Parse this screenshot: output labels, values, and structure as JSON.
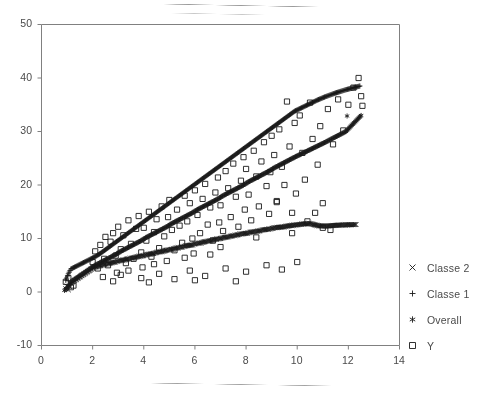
{
  "chart_data": {
    "type": "scatter",
    "title": "",
    "xlabel": "",
    "ylabel": "",
    "xlim": [
      0,
      14
    ],
    "ylim": [
      -10,
      50
    ],
    "xticks": [
      0,
      2,
      4,
      6,
      8,
      10,
      12,
      14
    ],
    "yticks": [
      -10,
      0,
      10,
      20,
      30,
      40,
      50
    ],
    "grid": false,
    "legend_position": "right",
    "frame": "open-left-top-right",
    "marker_color": "#1a1a1a",
    "axis_color": "#808080",
    "text_color": "#4a4a4a",
    "series": [
      {
        "name": "Classe 2",
        "marker": "cross",
        "description": "Lower flat fitted band, slope ~0.85",
        "points": [
          [
            0.95,
            0.6
          ],
          [
            1.0,
            1.1
          ],
          [
            1.05,
            0.4
          ],
          [
            1.12,
            1.6
          ],
          [
            2.05,
            4.6
          ],
          [
            2.2,
            4.8
          ],
          [
            2.35,
            5.0
          ],
          [
            2.5,
            5.2
          ],
          [
            2.62,
            5.3
          ],
          [
            2.75,
            5.5
          ],
          [
            2.88,
            5.6
          ],
          [
            3.0,
            5.8
          ],
          [
            3.12,
            5.9
          ],
          [
            3.25,
            6.0
          ],
          [
            3.38,
            6.2
          ],
          [
            3.5,
            6.3
          ],
          [
            3.62,
            6.4
          ],
          [
            3.75,
            6.6
          ],
          [
            3.88,
            6.7
          ],
          [
            4.0,
            6.8
          ],
          [
            4.12,
            7.0
          ],
          [
            4.25,
            7.1
          ],
          [
            4.38,
            7.2
          ],
          [
            4.5,
            7.4
          ],
          [
            4.62,
            7.5
          ],
          [
            4.75,
            7.6
          ],
          [
            4.88,
            7.8
          ],
          [
            5.0,
            7.9
          ],
          [
            5.12,
            8.0
          ],
          [
            5.25,
            8.2
          ],
          [
            5.38,
            8.3
          ],
          [
            5.5,
            8.4
          ],
          [
            5.62,
            8.6
          ],
          [
            5.75,
            8.7
          ],
          [
            5.88,
            8.8
          ],
          [
            6.0,
            9.0
          ],
          [
            6.12,
            9.1
          ],
          [
            6.25,
            9.2
          ],
          [
            6.38,
            9.4
          ],
          [
            6.5,
            9.5
          ],
          [
            6.62,
            9.6
          ],
          [
            6.75,
            9.8
          ],
          [
            6.88,
            9.9
          ],
          [
            7.0,
            10.0
          ],
          [
            7.15,
            10.2
          ],
          [
            7.3,
            10.3
          ],
          [
            7.45,
            10.5
          ],
          [
            7.6,
            10.6
          ],
          [
            7.75,
            10.8
          ],
          [
            7.9,
            10.9
          ],
          [
            8.05,
            11.0
          ],
          [
            8.2,
            11.2
          ],
          [
            8.35,
            11.3
          ],
          [
            8.5,
            11.4
          ],
          [
            8.65,
            11.6
          ],
          [
            8.8,
            11.7
          ],
          [
            8.95,
            11.8
          ],
          [
            9.1,
            12.0
          ],
          [
            9.3,
            12.1
          ],
          [
            9.5,
            12.2
          ],
          [
            9.7,
            12.4
          ],
          [
            9.9,
            12.5
          ],
          [
            10.2,
            12.7
          ],
          [
            10.5,
            12.8
          ],
          [
            10.8,
            12.4
          ],
          [
            11.1,
            12.3
          ],
          [
            11.6,
            12.5
          ],
          [
            12.3,
            12.6
          ]
        ]
      },
      {
        "name": "Classe 1",
        "marker": "plus",
        "description": "Upper steep fitted band, slope ~3.3",
        "points": [
          [
            0.95,
            2.2
          ],
          [
            1.05,
            3.4
          ],
          [
            1.15,
            4.3
          ],
          [
            2.1,
            6.6
          ],
          [
            2.3,
            7.2
          ],
          [
            2.5,
            7.9
          ],
          [
            2.7,
            8.6
          ],
          [
            2.9,
            9.3
          ],
          [
            3.1,
            10.0
          ],
          [
            3.3,
            10.7
          ],
          [
            3.5,
            11.4
          ],
          [
            3.7,
            12.1
          ],
          [
            3.9,
            12.8
          ],
          [
            4.1,
            13.5
          ],
          [
            4.3,
            14.2
          ],
          [
            4.5,
            14.9
          ],
          [
            4.7,
            15.6
          ],
          [
            4.9,
            16.3
          ],
          [
            5.1,
            17.0
          ],
          [
            5.3,
            17.7
          ],
          [
            5.5,
            18.4
          ],
          [
            5.7,
            19.1
          ],
          [
            5.9,
            19.8
          ],
          [
            6.1,
            20.5
          ],
          [
            6.3,
            21.2
          ],
          [
            6.5,
            21.9
          ],
          [
            6.7,
            22.6
          ],
          [
            6.9,
            23.3
          ],
          [
            7.1,
            24.0
          ],
          [
            7.3,
            24.7
          ],
          [
            7.5,
            25.4
          ],
          [
            7.7,
            26.1
          ],
          [
            7.9,
            26.8
          ],
          [
            8.1,
            27.5
          ],
          [
            8.3,
            28.2
          ],
          [
            8.5,
            28.9
          ],
          [
            8.7,
            29.6
          ],
          [
            8.9,
            30.3
          ],
          [
            9.1,
            31.0
          ],
          [
            9.3,
            31.7
          ],
          [
            9.5,
            32.4
          ],
          [
            9.7,
            33.1
          ],
          [
            9.9,
            33.8
          ],
          [
            10.2,
            34.5
          ],
          [
            10.5,
            35.2
          ],
          [
            10.8,
            35.9
          ],
          [
            11.1,
            36.5
          ],
          [
            11.5,
            37.2
          ],
          [
            11.9,
            37.8
          ],
          [
            12.45,
            38.5
          ]
        ]
      },
      {
        "name": "Overall",
        "marker": "asterisk",
        "description": "Middle fitted band, slope ~2.6",
        "points": [
          [
            0.9,
            0.3
          ],
          [
            1.0,
            0.8
          ],
          [
            1.1,
            1.4
          ],
          [
            1.2,
            2.0
          ],
          [
            2.1,
            5.0
          ],
          [
            2.3,
            5.5
          ],
          [
            2.5,
            6.0
          ],
          [
            2.7,
            6.5
          ],
          [
            2.9,
            7.0
          ],
          [
            3.1,
            7.6
          ],
          [
            3.3,
            8.1
          ],
          [
            3.5,
            8.6
          ],
          [
            3.7,
            9.1
          ],
          [
            3.9,
            9.6
          ],
          [
            4.1,
            10.2
          ],
          [
            4.3,
            10.7
          ],
          [
            4.5,
            11.2
          ],
          [
            4.7,
            11.7
          ],
          [
            4.9,
            12.2
          ],
          [
            5.1,
            12.8
          ],
          [
            5.3,
            13.3
          ],
          [
            5.5,
            13.8
          ],
          [
            5.7,
            14.3
          ],
          [
            5.9,
            14.8
          ],
          [
            6.1,
            15.4
          ],
          [
            6.3,
            15.9
          ],
          [
            6.5,
            16.4
          ],
          [
            6.7,
            16.9
          ],
          [
            6.9,
            17.4
          ],
          [
            7.1,
            18.0
          ],
          [
            7.3,
            18.5
          ],
          [
            7.5,
            19.0
          ],
          [
            7.7,
            19.5
          ],
          [
            7.9,
            20.0
          ],
          [
            8.1,
            20.6
          ],
          [
            8.3,
            21.1
          ],
          [
            8.5,
            21.6
          ],
          [
            8.7,
            22.1
          ],
          [
            8.9,
            22.6
          ],
          [
            9.1,
            23.2
          ],
          [
            9.3,
            23.7
          ],
          [
            9.5,
            24.2
          ],
          [
            9.7,
            24.7
          ],
          [
            9.9,
            25.2
          ],
          [
            10.2,
            25.9
          ],
          [
            10.5,
            26.6
          ],
          [
            10.8,
            27.3
          ],
          [
            11.1,
            28.0
          ],
          [
            11.5,
            29.0
          ],
          [
            11.9,
            30.0
          ],
          [
            12.2,
            31.5
          ],
          [
            12.5,
            33.0
          ],
          [
            11.95,
            32.9
          ]
        ]
      },
      {
        "name": "Y",
        "marker": "square",
        "description": "Raw observations scattered around all three bands",
        "points": [
          [
            0.95,
            1.9
          ],
          [
            1.05,
            2.6
          ],
          [
            1.15,
            0.9
          ],
          [
            1.25,
            1.2
          ],
          [
            2.0,
            5.6
          ],
          [
            2.1,
            7.6
          ],
          [
            2.2,
            4.4
          ],
          [
            2.3,
            8.8
          ],
          [
            2.45,
            6.2
          ],
          [
            2.5,
            10.3
          ],
          [
            2.6,
            5.0
          ],
          [
            2.7,
            9.4
          ],
          [
            2.8,
            11.0
          ],
          [
            2.9,
            6.8
          ],
          [
            2.95,
            3.6
          ],
          [
            3.0,
            12.2
          ],
          [
            3.1,
            8.0
          ],
          [
            3.2,
            10.6
          ],
          [
            3.3,
            5.4
          ],
          [
            3.4,
            13.4
          ],
          [
            3.5,
            9.0
          ],
          [
            3.6,
            6.2
          ],
          [
            3.7,
            11.8
          ],
          [
            3.8,
            14.2
          ],
          [
            3.9,
            7.4
          ],
          [
            3.95,
            4.6
          ],
          [
            4.0,
            12.0
          ],
          [
            4.1,
            9.6
          ],
          [
            4.2,
            15.0
          ],
          [
            4.3,
            6.6
          ],
          [
            4.4,
            11.2
          ],
          [
            4.5,
            13.6
          ],
          [
            4.6,
            8.2
          ],
          [
            4.7,
            16.0
          ],
          [
            4.8,
            10.4
          ],
          [
            4.9,
            5.8
          ],
          [
            4.95,
            14.0
          ],
          [
            5.0,
            17.2
          ],
          [
            5.1,
            11.6
          ],
          [
            5.2,
            7.8
          ],
          [
            5.3,
            15.4
          ],
          [
            5.4,
            12.4
          ],
          [
            5.5,
            9.2
          ],
          [
            5.6,
            18.0
          ],
          [
            5.7,
            13.2
          ],
          [
            5.8,
            16.6
          ],
          [
            5.9,
            10.0
          ],
          [
            5.95,
            7.2
          ],
          [
            6.0,
            19.0
          ],
          [
            6.1,
            14.4
          ],
          [
            6.2,
            11.0
          ],
          [
            6.3,
            17.4
          ],
          [
            6.4,
            20.2
          ],
          [
            6.5,
            12.6
          ],
          [
            6.6,
            15.8
          ],
          [
            6.7,
            9.6
          ],
          [
            6.8,
            18.6
          ],
          [
            6.9,
            21.4
          ],
          [
            6.95,
            13.0
          ],
          [
            7.0,
            16.2
          ],
          [
            7.1,
            11.4
          ],
          [
            7.2,
            22.6
          ],
          [
            7.3,
            19.4
          ],
          [
            7.4,
            14.0
          ],
          [
            7.5,
            24.0
          ],
          [
            7.6,
            17.8
          ],
          [
            7.7,
            12.2
          ],
          [
            7.8,
            20.8
          ],
          [
            7.9,
            25.2
          ],
          [
            7.95,
            15.4
          ],
          [
            8.0,
            23.0
          ],
          [
            8.1,
            18.2
          ],
          [
            8.2,
            13.4
          ],
          [
            8.3,
            26.4
          ],
          [
            8.4,
            21.6
          ],
          [
            8.5,
            16.0
          ],
          [
            8.6,
            24.4
          ],
          [
            8.7,
            28.0
          ],
          [
            8.8,
            19.8
          ],
          [
            8.9,
            14.6
          ],
          [
            8.95,
            22.4
          ],
          [
            9.0,
            29.2
          ],
          [
            9.1,
            25.6
          ],
          [
            9.2,
            17.0
          ],
          [
            9.3,
            30.4
          ],
          [
            9.4,
            23.4
          ],
          [
            9.5,
            20.0
          ],
          [
            9.6,
            35.6
          ],
          [
            9.7,
            27.2
          ],
          [
            9.8,
            14.8
          ],
          [
            9.9,
            31.6
          ],
          [
            9.95,
            18.4
          ],
          [
            10.1,
            33.0
          ],
          [
            10.2,
            26.0
          ],
          [
            10.3,
            21.0
          ],
          [
            10.5,
            35.4
          ],
          [
            10.6,
            28.6
          ],
          [
            10.8,
            23.8
          ],
          [
            10.9,
            31.0
          ],
          [
            11.0,
            16.6
          ],
          [
            11.2,
            34.2
          ],
          [
            11.4,
            27.6
          ],
          [
            11.6,
            36.0
          ],
          [
            11.8,
            30.2
          ],
          [
            12.0,
            35.0
          ],
          [
            12.2,
            38.2
          ],
          [
            12.4,
            40.0
          ],
          [
            12.5,
            36.6
          ],
          [
            12.55,
            34.8
          ],
          [
            2.4,
            2.8
          ],
          [
            3.1,
            3.2
          ],
          [
            3.9,
            2.6
          ],
          [
            4.6,
            3.4
          ],
          [
            5.2,
            2.4
          ],
          [
            5.8,
            4.0
          ],
          [
            6.4,
            3.0
          ],
          [
            7.2,
            4.4
          ],
          [
            8.0,
            3.8
          ],
          [
            8.8,
            5.0
          ],
          [
            9.4,
            4.2
          ],
          [
            10.0,
            5.6
          ],
          [
            4.2,
            1.8
          ],
          [
            6.0,
            2.2
          ],
          [
            7.6,
            2.0
          ],
          [
            9.2,
            16.8
          ],
          [
            10.4,
            13.2
          ],
          [
            11.0,
            12.0
          ],
          [
            8.4,
            10.2
          ],
          [
            7.0,
            8.4
          ],
          [
            5.6,
            6.4
          ],
          [
            4.4,
            5.2
          ],
          [
            3.4,
            4.0
          ],
          [
            2.8,
            2.0
          ],
          [
            6.6,
            7.0
          ],
          [
            9.8,
            11.0
          ],
          [
            10.7,
            14.8
          ],
          [
            11.3,
            11.6
          ]
        ]
      }
    ]
  },
  "legend": {
    "items": [
      {
        "label": "Classe 2",
        "marker": "cross"
      },
      {
        "label": "Classe 1",
        "marker": "plus"
      },
      {
        "label": "Overall",
        "marker": "asterisk"
      },
      {
        "label": "Y",
        "marker": "square"
      }
    ]
  }
}
